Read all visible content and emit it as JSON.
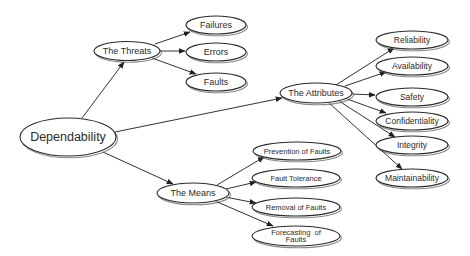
{
  "diagram": {
    "type": "concept-map",
    "root": {
      "id": "dependability",
      "label": "Dependability"
    },
    "nodes": [
      {
        "id": "dependability",
        "label": "Dependability",
        "cx": 68,
        "cy": 137,
        "rx": 48,
        "ry": 19,
        "fs": 12.5
      },
      {
        "id": "threats",
        "label": "The Threats",
        "cx": 127,
        "cy": 51,
        "rx": 33,
        "ry": 9.5,
        "fs": 9
      },
      {
        "id": "failures",
        "label": "Failures",
        "cx": 216,
        "cy": 25,
        "rx": 30,
        "ry": 9,
        "fs": 9
      },
      {
        "id": "errors",
        "label": "Errors",
        "cx": 216,
        "cy": 52,
        "rx": 30,
        "ry": 9,
        "fs": 9
      },
      {
        "id": "faults",
        "label": "Faults",
        "cx": 216,
        "cy": 82,
        "rx": 30,
        "ry": 9,
        "fs": 9
      },
      {
        "id": "attributes",
        "label": "The Attributes",
        "cx": 316,
        "cy": 93,
        "rx": 36,
        "ry": 10,
        "fs": 9
      },
      {
        "id": "reliability",
        "label": "Reliability",
        "cx": 412,
        "cy": 40,
        "rx": 36,
        "ry": 9,
        "fs": 8.5
      },
      {
        "id": "availability",
        "label": "Availability",
        "cx": 412,
        "cy": 66,
        "rx": 36,
        "ry": 9,
        "fs": 8.5
      },
      {
        "id": "safety",
        "label": "Safety",
        "cx": 412,
        "cy": 97,
        "rx": 36,
        "ry": 9,
        "fs": 8.5
      },
      {
        "id": "confidentiality",
        "label": "Confidentiality",
        "cx": 412,
        "cy": 121,
        "rx": 36,
        "ry": 9,
        "fs": 8.5
      },
      {
        "id": "integrity",
        "label": "Integrity",
        "cx": 412,
        "cy": 145,
        "rx": 36,
        "ry": 9,
        "fs": 8.5
      },
      {
        "id": "maintainability",
        "label": "Maintainability",
        "cx": 412,
        "cy": 178,
        "rx": 36,
        "ry": 9,
        "fs": 8.5
      },
      {
        "id": "means",
        "label": "The Means",
        "cx": 193,
        "cy": 193,
        "rx": 36,
        "ry": 10,
        "fs": 9
      },
      {
        "id": "prevention",
        "label": "Prevention of Faults",
        "cx": 297,
        "cy": 151,
        "rx": 44,
        "ry": 9,
        "fs": 7.5
      },
      {
        "id": "tolerance",
        "label": "Fault Tolerance",
        "cx": 296,
        "cy": 178,
        "rx": 44,
        "ry": 9,
        "fs": 7.5
      },
      {
        "id": "removal",
        "label": "Removal of Faults",
        "cx": 296,
        "cy": 207,
        "rx": 44,
        "ry": 9,
        "fs": 7.5
      },
      {
        "id": "forecasting",
        "label": "Forecasting  of\nFaults",
        "cx": 296,
        "cy": 236,
        "rx": 44,
        "ry": 10,
        "fs": 7.5
      }
    ],
    "edges": [
      {
        "from": "dependability",
        "to": "threats",
        "x1": 82,
        "y1": 118,
        "x2": 124,
        "y2": 62
      },
      {
        "from": "dependability",
        "to": "attributes",
        "x1": 115,
        "y1": 132,
        "x2": 282,
        "y2": 98
      },
      {
        "from": "dependability",
        "to": "means",
        "x1": 103,
        "y1": 152,
        "x2": 173,
        "y2": 184
      },
      {
        "from": "threats",
        "to": "failures",
        "x1": 155,
        "y1": 44,
        "x2": 190,
        "y2": 32
      },
      {
        "from": "threats",
        "to": "errors",
        "x1": 160,
        "y1": 51,
        "x2": 185,
        "y2": 51
      },
      {
        "from": "threats",
        "to": "faults",
        "x1": 152,
        "y1": 58,
        "x2": 196,
        "y2": 74
      },
      {
        "from": "attributes",
        "to": "reliability",
        "x1": 336,
        "y1": 85,
        "x2": 394,
        "y2": 48
      },
      {
        "from": "attributes",
        "to": "availability",
        "x1": 345,
        "y1": 86,
        "x2": 386,
        "y2": 72
      },
      {
        "from": "attributes",
        "to": "safety",
        "x1": 352,
        "y1": 94,
        "x2": 375,
        "y2": 95
      },
      {
        "from": "attributes",
        "to": "confidentiality",
        "x1": 347,
        "y1": 99,
        "x2": 386,
        "y2": 113
      },
      {
        "from": "attributes",
        "to": "integrity",
        "x1": 339,
        "y1": 101,
        "x2": 395,
        "y2": 137
      },
      {
        "from": "attributes",
        "to": "maintainability",
        "x1": 328,
        "y1": 102,
        "x2": 402,
        "y2": 169
      },
      {
        "from": "means",
        "to": "prevention",
        "x1": 217,
        "y1": 185,
        "x2": 264,
        "y2": 157
      },
      {
        "from": "means",
        "to": "tolerance",
        "x1": 226,
        "y1": 189,
        "x2": 256,
        "y2": 182
      },
      {
        "from": "means",
        "to": "removal",
        "x1": 225,
        "y1": 197,
        "x2": 256,
        "y2": 203
      },
      {
        "from": "means",
        "to": "forecasting",
        "x1": 215,
        "y1": 201,
        "x2": 273,
        "y2": 226
      }
    ]
  }
}
